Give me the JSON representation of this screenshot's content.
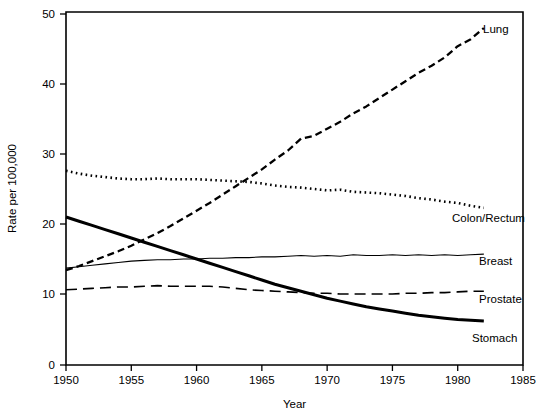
{
  "chart_data": {
    "type": "line",
    "title": "",
    "xlabel": "Year",
    "ylabel": "Rate per 100,000",
    "xlim": [
      1950,
      1985
    ],
    "ylim": [
      0,
      50
    ],
    "grid": false,
    "legend_position": "right-inline-labels",
    "xticks": [
      "1950",
      "1955",
      "1960",
      "1965",
      "1970",
      "1975",
      "1980",
      "1985"
    ],
    "xtick_values": [
      1950,
      1955,
      1960,
      1965,
      1970,
      1975,
      1980,
      1985
    ],
    "yticks": [
      "0",
      "10",
      "20",
      "30",
      "40",
      "50"
    ],
    "ytick_values": [
      0,
      10,
      20,
      30,
      40,
      50
    ],
    "y_axis_note": "axis compressed between 0 and 10",
    "series": [
      {
        "name": "Lung",
        "style": "dashed",
        "label": "Lung",
        "x": [
          1950,
          1951,
          1952,
          1953,
          1954,
          1955,
          1956,
          1957,
          1958,
          1959,
          1960,
          1961,
          1962,
          1963,
          1964,
          1965,
          1966,
          1967,
          1968,
          1969,
          1970,
          1971,
          1972,
          1973,
          1974,
          1975,
          1976,
          1977,
          1978,
          1979,
          1980,
          1981,
          1982
        ],
        "values": [
          13.4,
          14.0,
          14.7,
          15.4,
          16.1,
          16.9,
          17.8,
          18.7,
          19.7,
          20.8,
          21.9,
          23.0,
          24.2,
          25.4,
          26.6,
          27.8,
          29.2,
          30.5,
          32.2,
          32.6,
          33.6,
          34.6,
          35.8,
          36.8,
          38.0,
          39.2,
          40.4,
          41.6,
          42.6,
          43.8,
          45.4,
          46.4,
          48.0
        ]
      },
      {
        "name": "Colon/Rectum",
        "style": "dotted",
        "label": "Colon/Rectum",
        "x": [
          1950,
          1951,
          1952,
          1953,
          1954,
          1955,
          1956,
          1957,
          1958,
          1959,
          1960,
          1961,
          1962,
          1963,
          1964,
          1965,
          1966,
          1967,
          1968,
          1969,
          1970,
          1971,
          1972,
          1973,
          1974,
          1975,
          1976,
          1977,
          1978,
          1979,
          1980,
          1981,
          1982
        ],
        "values": [
          27.6,
          27.2,
          26.9,
          26.7,
          26.5,
          26.4,
          26.4,
          26.5,
          26.4,
          26.4,
          26.4,
          26.3,
          26.2,
          26.1,
          26.0,
          25.8,
          25.5,
          25.3,
          25.2,
          25.0,
          24.8,
          24.9,
          24.6,
          24.5,
          24.4,
          24.2,
          24.0,
          23.7,
          23.5,
          23.2,
          23.0,
          22.6,
          22.3
        ]
      },
      {
        "name": "Breast",
        "style": "thin-solid",
        "label": "Breast",
        "x": [
          1950,
          1951,
          1952,
          1953,
          1954,
          1955,
          1956,
          1957,
          1958,
          1959,
          1960,
          1961,
          1962,
          1963,
          1964,
          1965,
          1966,
          1967,
          1968,
          1969,
          1970,
          1971,
          1972,
          1973,
          1974,
          1975,
          1976,
          1977,
          1978,
          1979,
          1980,
          1981,
          1982
        ],
        "values": [
          13.7,
          13.9,
          14.1,
          14.3,
          14.5,
          14.7,
          14.8,
          14.9,
          14.9,
          15.0,
          15.0,
          15.1,
          15.1,
          15.2,
          15.2,
          15.3,
          15.3,
          15.4,
          15.5,
          15.4,
          15.5,
          15.4,
          15.6,
          15.5,
          15.5,
          15.6,
          15.5,
          15.6,
          15.5,
          15.6,
          15.5,
          15.6,
          15.7
        ]
      },
      {
        "name": "Prostate",
        "style": "long-dashed",
        "label": "Prostate",
        "x": [
          1950,
          1951,
          1952,
          1953,
          1954,
          1955,
          1956,
          1957,
          1958,
          1959,
          1960,
          1961,
          1962,
          1963,
          1964,
          1965,
          1966,
          1967,
          1968,
          1969,
          1970,
          1971,
          1972,
          1973,
          1974,
          1975,
          1976,
          1977,
          1978,
          1979,
          1980,
          1981,
          1982
        ],
        "values": [
          10.6,
          10.7,
          10.8,
          10.9,
          11.0,
          11.0,
          11.1,
          11.2,
          11.1,
          11.1,
          11.1,
          11.1,
          11.0,
          10.8,
          10.6,
          10.5,
          10.4,
          10.3,
          10.2,
          10.1,
          10.1,
          10.0,
          10.0,
          10.0,
          10.0,
          10.0,
          10.1,
          10.1,
          10.2,
          10.2,
          10.3,
          10.4,
          10.4
        ]
      },
      {
        "name": "Stomach",
        "style": "thick-solid",
        "label": "Stomach",
        "x": [
          1950,
          1951,
          1952,
          1953,
          1954,
          1955,
          1956,
          1957,
          1958,
          1959,
          1960,
          1961,
          1962,
          1963,
          1964,
          1965,
          1966,
          1967,
          1968,
          1969,
          1970,
          1971,
          1972,
          1973,
          1974,
          1975,
          1976,
          1977,
          1978,
          1979,
          1980,
          1981,
          1982
        ],
        "values": [
          21.0,
          20.4,
          19.8,
          19.2,
          18.6,
          18.0,
          17.4,
          16.8,
          16.2,
          15.6,
          15.0,
          14.4,
          13.8,
          13.2,
          12.6,
          12.0,
          11.4,
          10.9,
          10.4,
          9.9,
          9.4,
          9.0,
          8.6,
          8.2,
          7.9,
          7.6,
          7.3,
          7.0,
          6.8,
          6.6,
          6.4,
          6.3,
          6.2
        ]
      }
    ]
  },
  "colors": {
    "axis": "#000000",
    "series": "#000000",
    "background": "#ffffff"
  }
}
